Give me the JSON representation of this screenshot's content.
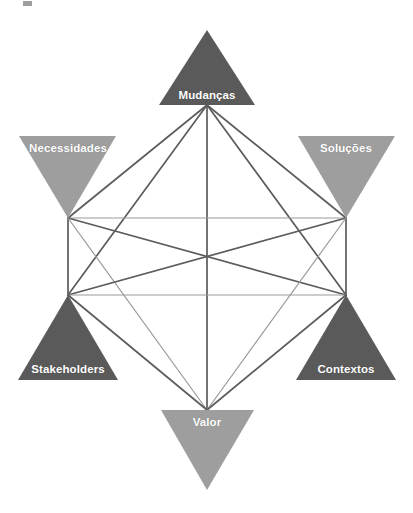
{
  "diagram": {
    "type": "hexagram-network",
    "background_color": "#ffffff",
    "colors": {
      "dark_triangle": "#5a5a5a",
      "light_triangle": "#9e9e9e",
      "dark_edge": "#5c5c5c",
      "light_edge": "#9a9a9a",
      "label_text": "#ffffff"
    },
    "center": {
      "x": 207,
      "y": 262
    },
    "nodes": [
      {
        "id": "mudancas",
        "label": "Mudanças",
        "orientation": "up",
        "shade": "dark",
        "position": "top",
        "vertex": {
          "x": 207,
          "y": 105
        },
        "label_x": 207,
        "label_y": 95,
        "points": "207,30 255,105 159,105"
      },
      {
        "id": "necessidades",
        "label": "Necessidades",
        "orientation": "down",
        "shade": "light",
        "position": "upper-left",
        "vertex": {
          "x": 68,
          "y": 218
        },
        "label_x": 68,
        "label_y": 148,
        "points": "19,136 116,136 68,218"
      },
      {
        "id": "solucoes",
        "label": "Soluções",
        "orientation": "down",
        "shade": "light",
        "position": "upper-right",
        "vertex": {
          "x": 346,
          "y": 218
        },
        "label_x": 346,
        "label_y": 148,
        "points": "298,136 395,136 346,218"
      },
      {
        "id": "stakeholders",
        "label": "Stakeholders",
        "orientation": "up",
        "shade": "dark",
        "position": "lower-left",
        "vertex": {
          "x": 68,
          "y": 295
        },
        "label_x": 68,
        "label_y": 369,
        "points": "68,295 118,380 18,380"
      },
      {
        "id": "contextos",
        "label": "Contextos",
        "orientation": "up",
        "shade": "dark",
        "position": "lower-right",
        "vertex": {
          "x": 346,
          "y": 295
        },
        "label_x": 346,
        "label_y": 369,
        "points": "346,295 396,380 296,380"
      },
      {
        "id": "valor",
        "label": "Valor",
        "orientation": "down",
        "shade": "light",
        "position": "bottom",
        "vertex": {
          "x": 207,
          "y": 410
        },
        "label_x": 207,
        "label_y": 422,
        "points": "161,410 254,410 207,490"
      }
    ],
    "edges": [
      {
        "from": "mudancas",
        "to": "necessidades",
        "shade": "dark"
      },
      {
        "from": "mudancas",
        "to": "solucoes",
        "shade": "dark"
      },
      {
        "from": "mudancas",
        "to": "stakeholders",
        "shade": "dark"
      },
      {
        "from": "mudancas",
        "to": "contextos",
        "shade": "dark"
      },
      {
        "from": "mudancas",
        "to": "valor",
        "shade": "dark"
      },
      {
        "from": "necessidades",
        "to": "solucoes",
        "shade": "light"
      },
      {
        "from": "necessidades",
        "to": "stakeholders",
        "shade": "dark"
      },
      {
        "from": "necessidades",
        "to": "contextos",
        "shade": "dark"
      },
      {
        "from": "necessidades",
        "to": "valor",
        "shade": "light"
      },
      {
        "from": "solucoes",
        "to": "stakeholders",
        "shade": "dark"
      },
      {
        "from": "solucoes",
        "to": "contextos",
        "shade": "dark"
      },
      {
        "from": "solucoes",
        "to": "valor",
        "shade": "light"
      },
      {
        "from": "stakeholders",
        "to": "contextos",
        "shade": "light"
      },
      {
        "from": "stakeholders",
        "to": "valor",
        "shade": "dark"
      },
      {
        "from": "contextos",
        "to": "valor",
        "shade": "dark"
      }
    ]
  }
}
